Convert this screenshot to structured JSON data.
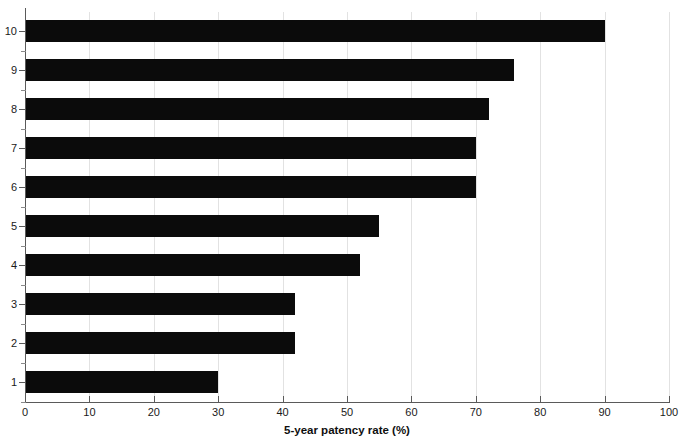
{
  "chart_data": {
    "type": "bar",
    "orientation": "horizontal",
    "title": "",
    "xlabel": "5-year patency rate (%)",
    "ylabel": "",
    "categories": [
      "1",
      "2",
      "3",
      "4",
      "5",
      "6",
      "7",
      "8",
      "9",
      "10"
    ],
    "values": [
      30,
      42,
      42,
      52,
      55,
      70,
      70,
      72,
      76,
      90
    ],
    "series": [
      {
        "name": "5-year patency rate",
        "values": [
          30,
          42,
          42,
          52,
          55,
          70,
          70,
          72,
          76,
          90
        ]
      }
    ],
    "bars": [
      {
        "category": "10",
        "value": 90
      },
      {
        "category": "9",
        "value": 76
      },
      {
        "category": "8",
        "value": 72
      },
      {
        "category": "7",
        "value": 70
      },
      {
        "category": "6",
        "value": 70
      },
      {
        "category": "5",
        "value": 55
      },
      {
        "category": "4",
        "value": 52
      },
      {
        "category": "3",
        "value": 42
      },
      {
        "category": "2",
        "value": 42
      },
      {
        "category": "1",
        "value": 30
      }
    ],
    "xlim": [
      0,
      100
    ],
    "xticks": [
      0,
      10,
      20,
      30,
      40,
      50,
      60,
      70,
      80,
      90,
      100
    ],
    "xtick_labels": [
      "0",
      "10",
      "20",
      "30",
      "40",
      "50",
      "60",
      "70",
      "80",
      "90",
      "100"
    ],
    "yticks": [
      "1",
      "2",
      "3",
      "4",
      "5",
      "6",
      "7",
      "8",
      "9",
      "10"
    ],
    "grid": "vertical",
    "legend": "none",
    "bar_color": "#0b0b0b",
    "grid_color": "#e2e2e2",
    "axis_color": "#5a5a5a",
    "background_color": "#ffffff"
  }
}
